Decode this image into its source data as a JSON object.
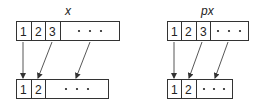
{
  "diagrams": [
    {
      "label": "x",
      "source_cells": [
        "1",
        "2",
        "3",
        "• • •"
      ],
      "target_cells": [
        "1",
        "2",
        "• • •"
      ],
      "mappings": [
        {
          "from": "1",
          "to": "1"
        },
        {
          "from": "3",
          "to": "2"
        },
        {
          "from": "• • •",
          "to": "• • •"
        }
      ]
    },
    {
      "label": "px",
      "source_cells": [
        "1",
        "2",
        "3",
        "• • •"
      ],
      "target_cells": [
        "1",
        "2",
        "• • •"
      ],
      "mappings": [
        {
          "from": "1",
          "to": "1"
        },
        {
          "from": "3",
          "to": "2"
        },
        {
          "from": "• • •",
          "to": "• • •"
        }
      ]
    }
  ],
  "colors": {
    "stroke": "#333333",
    "text": "#222222",
    "background": "#ffffff"
  }
}
